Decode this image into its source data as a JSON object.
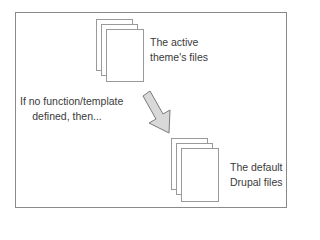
{
  "diagram": {
    "top_stack": {
      "icon": "document-stack-icon",
      "label_lines": [
        "The active",
        "theme's files"
      ]
    },
    "condition": {
      "label_lines": [
        "If no function/template",
        "defined, then..."
      ]
    },
    "arrow": {
      "icon": "arrow-down-right-icon",
      "fill": "#d9d9d9",
      "stroke": "#7a7a7a"
    },
    "bottom_stack": {
      "icon": "document-stack-icon",
      "label_lines": [
        "The default",
        "Drupal files"
      ]
    },
    "colors": {
      "frame_border": "#8a8a8a",
      "page_border": "#9a9a9a",
      "text": "#3a3a3a"
    }
  }
}
